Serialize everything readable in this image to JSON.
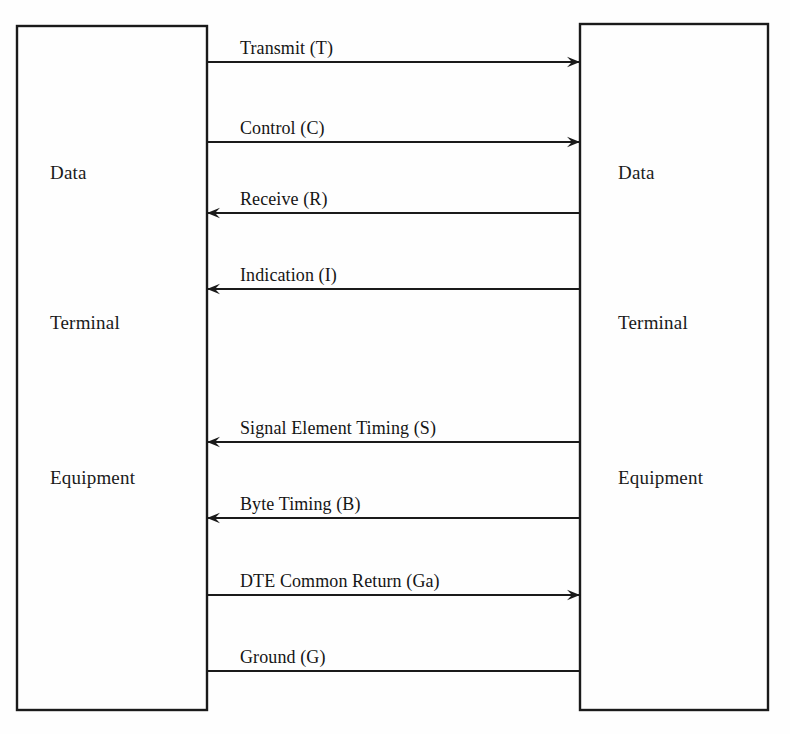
{
  "diagram": {
    "background_color": "#fefefe",
    "line_color": "#1a1a1a",
    "canvas": {
      "width": 790,
      "height": 734
    },
    "left_box": {
      "name": "Data Terminal Equipment",
      "x": 17,
      "y": 26,
      "width": 190,
      "height": 684,
      "label_x": 50,
      "labels": [
        {
          "text": "Data",
          "y": 179
        },
        {
          "text": "Terminal",
          "y": 329
        },
        {
          "text": "Equipment",
          "y": 484
        }
      ]
    },
    "right_box": {
      "name": "Data Terminal Equipment",
      "x": 580,
      "y": 24,
      "width": 188,
      "height": 686,
      "label_x": 618,
      "labels": [
        {
          "text": "Data",
          "y": 179
        },
        {
          "text": "Terminal",
          "y": 329
        },
        {
          "text": "Equipment",
          "y": 484
        }
      ]
    },
    "circuits": [
      {
        "id": "transmit",
        "label": "Transmit (T)",
        "code": "T",
        "y": 62,
        "direction": "right",
        "arrowhead": true,
        "label_x": 240
      },
      {
        "id": "control",
        "label": "Control (C)",
        "code": "C",
        "y": 142,
        "direction": "right",
        "arrowhead": true,
        "label_x": 240
      },
      {
        "id": "receive",
        "label": "Receive (R)",
        "code": "R",
        "y": 213,
        "direction": "left",
        "arrowhead": true,
        "label_x": 240
      },
      {
        "id": "indication",
        "label": "Indication (I)",
        "code": "I",
        "y": 289,
        "direction": "left",
        "arrowhead": true,
        "label_x": 240
      },
      {
        "id": "signal-element-timing",
        "label": "Signal Element Timing (S)",
        "code": "S",
        "y": 442,
        "direction": "left",
        "arrowhead": true,
        "label_x": 240
      },
      {
        "id": "byte-timing",
        "label": "Byte Timing (B)",
        "code": "B",
        "y": 518,
        "direction": "left",
        "arrowhead": true,
        "label_x": 240
      },
      {
        "id": "dte-common-return",
        "label": "DTE Common Return (Ga)",
        "code": "Ga",
        "y": 595,
        "direction": "right",
        "arrowhead": true,
        "label_x": 240
      },
      {
        "id": "ground",
        "label": "Ground (G)",
        "code": "G",
        "y": 671,
        "direction": "none",
        "arrowhead": false,
        "label_x": 240
      }
    ]
  }
}
